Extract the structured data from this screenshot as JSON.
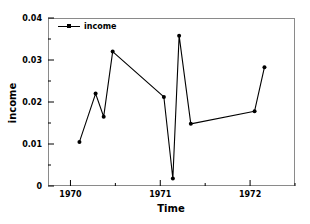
{
  "chart_data": {
    "type": "line",
    "title": "",
    "xlabel": "Time",
    "ylabel": "income",
    "xlim": [
      1969.75,
      1972.5
    ],
    "ylim": [
      0,
      0.04
    ],
    "grid": false,
    "legend_position": "top-left",
    "x_ticks": [
      {
        "value": 1970,
        "label": "1970"
      },
      {
        "value": 1971,
        "label": "1971"
      },
      {
        "value": 1972,
        "label": "1972"
      }
    ],
    "x_minor_ticks": [
      1970.5,
      1971.5,
      1972.5
    ],
    "y_ticks": [
      {
        "value": 0,
        "label": "0"
      },
      {
        "value": 0.01,
        "label": "0.01"
      },
      {
        "value": 0.02,
        "label": "0.02"
      },
      {
        "value": 0.03,
        "label": "0.03"
      },
      {
        "value": 0.04,
        "label": "0.04"
      }
    ],
    "y_minor_ticks": [
      0.005,
      0.015,
      0.025,
      0.035
    ],
    "series": [
      {
        "name": "income",
        "color": "#000000",
        "marker": "circle",
        "x": [
          1970.1,
          1970.28,
          1970.37,
          1970.47,
          1971.04,
          1971.14,
          1971.21,
          1971.34,
          1972.05,
          1972.16
        ],
        "values": [
          0.0105,
          0.022,
          0.0165,
          0.032,
          0.0212,
          0.0018,
          0.0358,
          0.0148,
          0.0178,
          0.0283
        ]
      }
    ]
  },
  "legend": {
    "entries": [
      {
        "label": "income"
      }
    ]
  },
  "axes": {
    "x_title": "Time",
    "y_title": "income"
  }
}
